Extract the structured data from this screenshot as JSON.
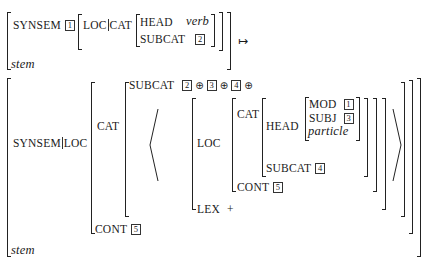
{
  "rule": {
    "arrow": "↦",
    "input": {
      "feature_synsem": "SYNSEM",
      "synsem_tag": "1",
      "loc_cat_path": [
        "LOC",
        "CAT"
      ],
      "head_label": "HEAD",
      "head_value": "verb",
      "subcat_label": "SUBCAT",
      "subcat_tag": "2",
      "type": "stem"
    },
    "output": {
      "path": [
        "SYNSEM",
        "LOC"
      ],
      "cat_label": "CAT",
      "subcat_label": "SUBCAT",
      "subcat_tags": [
        "2",
        "3",
        "4"
      ],
      "oplus": "⊕",
      "list_element": {
        "loc_label": "LOC",
        "cat_label": "CAT",
        "head_label": "HEAD",
        "mod_label": "MOD",
        "mod_tag": "1",
        "subj_label": "SUBJ",
        "subj_tag": "3",
        "head_type": "particle",
        "subcat_label": "SUBCAT",
        "subcat_tag": "4",
        "cont_label": "CONT",
        "cont_tag": "5",
        "lex_label": "LEX",
        "lex_value": "+"
      },
      "cont_label": "CONT",
      "cont_tag": "5",
      "type": "stem"
    }
  }
}
